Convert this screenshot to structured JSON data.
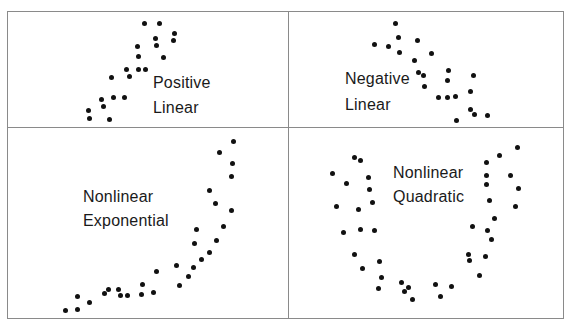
{
  "chart_data": [
    {
      "type": "scatter",
      "title": "Positive Linear",
      "label_lines": [
        "Positive",
        "Linear"
      ],
      "label_pos": [
        153,
        72
      ],
      "points": [
        [
          144,
          23
        ],
        [
          159,
          23
        ],
        [
          174,
          33
        ],
        [
          173,
          40
        ],
        [
          155,
          38
        ],
        [
          156,
          45
        ],
        [
          137,
          46
        ],
        [
          138,
          56
        ],
        [
          163,
          57
        ],
        [
          126,
          69
        ],
        [
          138,
          69
        ],
        [
          145,
          69
        ],
        [
          129,
          76
        ],
        [
          111,
          77
        ],
        [
          101,
          99
        ],
        [
          113,
          97
        ],
        [
          124,
          97
        ],
        [
          103,
          106
        ],
        [
          88,
          110
        ],
        [
          89,
          118
        ],
        [
          109,
          119
        ]
      ]
    },
    {
      "type": "scatter",
      "title": "Negative Linear",
      "label_lines": [
        "Negative",
        "Linear"
      ],
      "label_pos": [
        345,
        66
      ],
      "points": [
        [
          395,
          23
        ],
        [
          398,
          37
        ],
        [
          374,
          44
        ],
        [
          388,
          46
        ],
        [
          399,
          52
        ],
        [
          417,
          40
        ],
        [
          431,
          53
        ],
        [
          414,
          60
        ],
        [
          418,
          72
        ],
        [
          423,
          75
        ],
        [
          424,
          86
        ],
        [
          448,
          70
        ],
        [
          447,
          80
        ],
        [
          473,
          75
        ],
        [
          470,
          91
        ],
        [
          438,
          97
        ],
        [
          447,
          97
        ],
        [
          455,
          96
        ],
        [
          470,
          109
        ],
        [
          474,
          114
        ],
        [
          487,
          115
        ],
        [
          456,
          120
        ]
      ]
    },
    {
      "type": "scatter",
      "title": "Nonlinear Exponential",
      "label_lines": [
        "Nonlinear",
        "Exponential"
      ],
      "label_pos": [
        83,
        185
      ],
      "points": [
        [
          65,
          310
        ],
        [
          77,
          309
        ],
        [
          77,
          296
        ],
        [
          89,
          302
        ],
        [
          104,
          293
        ],
        [
          108,
          289
        ],
        [
          118,
          289
        ],
        [
          120,
          295
        ],
        [
          127,
          295
        ],
        [
          141,
          294
        ],
        [
          142,
          284
        ],
        [
          153,
          292
        ],
        [
          156,
          271
        ],
        [
          176,
          265
        ],
        [
          179,
          285
        ],
        [
          188,
          276
        ],
        [
          193,
          267
        ],
        [
          201,
          259
        ],
        [
          209,
          252
        ],
        [
          216,
          240
        ],
        [
          194,
          243
        ],
        [
          196,
          229
        ],
        [
          223,
          226
        ],
        [
          231,
          210
        ],
        [
          215,
          203
        ],
        [
          209,
          190
        ],
        [
          231,
          176
        ],
        [
          232,
          163
        ],
        [
          219,
          152
        ],
        [
          233,
          141
        ]
      ]
    },
    {
      "type": "scatter",
      "title": "Nonlinear Quadratic",
      "label_lines": [
        "Nonlinear",
        "Quadratic"
      ],
      "label_pos": [
        393,
        160
      ],
      "points": [
        [
          354,
          157
        ],
        [
          360,
          160
        ],
        [
          332,
          173
        ],
        [
          346,
          183
        ],
        [
          368,
          177
        ],
        [
          369,
          189
        ],
        [
          372,
          202
        ],
        [
          336,
          206
        ],
        [
          358,
          209
        ],
        [
          343,
          232
        ],
        [
          360,
          229
        ],
        [
          374,
          230
        ],
        [
          354,
          254
        ],
        [
          362,
          268
        ],
        [
          379,
          261
        ],
        [
          381,
          277
        ],
        [
          378,
          288
        ],
        [
          401,
          282
        ],
        [
          408,
          287
        ],
        [
          404,
          291
        ],
        [
          412,
          299
        ],
        [
          435,
          284
        ],
        [
          440,
          296
        ],
        [
          451,
          286
        ],
        [
          479,
          275
        ],
        [
          468,
          254
        ],
        [
          469,
          260
        ],
        [
          485,
          256
        ],
        [
          491,
          239
        ],
        [
          487,
          230
        ],
        [
          472,
          226
        ],
        [
          494,
          218
        ],
        [
          489,
          200
        ],
        [
          515,
          206
        ],
        [
          518,
          188
        ],
        [
          486,
          184
        ],
        [
          486,
          175
        ],
        [
          510,
          175
        ],
        [
          486,
          162
        ],
        [
          499,
          155
        ],
        [
          517,
          147
        ]
      ]
    }
  ],
  "panels": [
    {
      "name": "positive-linear",
      "line1": "Positive",
      "line2": "Linear"
    },
    {
      "name": "negative-linear",
      "line1": "Negative",
      "line2": "Linear"
    },
    {
      "name": "nonlinear-exponential",
      "line1": "Nonlinear",
      "line2": "Exponential"
    },
    {
      "name": "nonlinear-quadratic",
      "line1": "Nonlinear",
      "line2": "Quadratic"
    }
  ],
  "colors": {
    "dot": "#111111",
    "border": "#8a8a8a",
    "text": "#1a1a1a"
  }
}
